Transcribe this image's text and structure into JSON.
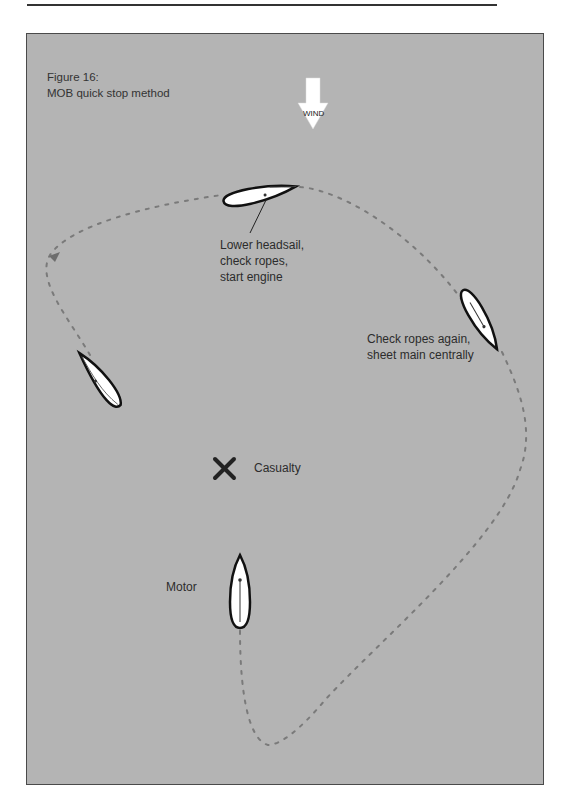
{
  "figure": {
    "number_label": "Figure 16:",
    "title": "MOB quick stop method"
  },
  "wind": {
    "label": "WIND",
    "direction": "down",
    "color": "#ffffff"
  },
  "labels": {
    "step1": "Lower headsail,\ncheck ropes,\nstart engine",
    "step2": "Check ropes again,\nsheet main centrally",
    "casualty": "Casualty",
    "motor": "Motor"
  },
  "colors": {
    "panel_bg": "#b4b4b4",
    "boat_fill": "#ffffff",
    "boat_outline": "#111111",
    "path_dots": "#7a7a7a",
    "casualty_mark": "#222222"
  },
  "icons": {
    "casualty": "x-mark-icon",
    "wind": "down-arrow-icon",
    "boat": "boat-icon"
  }
}
